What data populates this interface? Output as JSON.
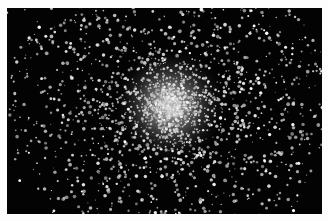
{
  "image": {
    "subject": "globular star cluster",
    "description": "Dense spherical cluster of stars against a black sky, bright core slightly right of center, stars thinning toward the edges",
    "background_color": "#030303",
    "border_color": "#fdfdfd",
    "star_color": "#ffffff",
    "core_center": {
      "x": 170,
      "y": 105
    },
    "core_radius": 45,
    "halo_radius": 150
  }
}
